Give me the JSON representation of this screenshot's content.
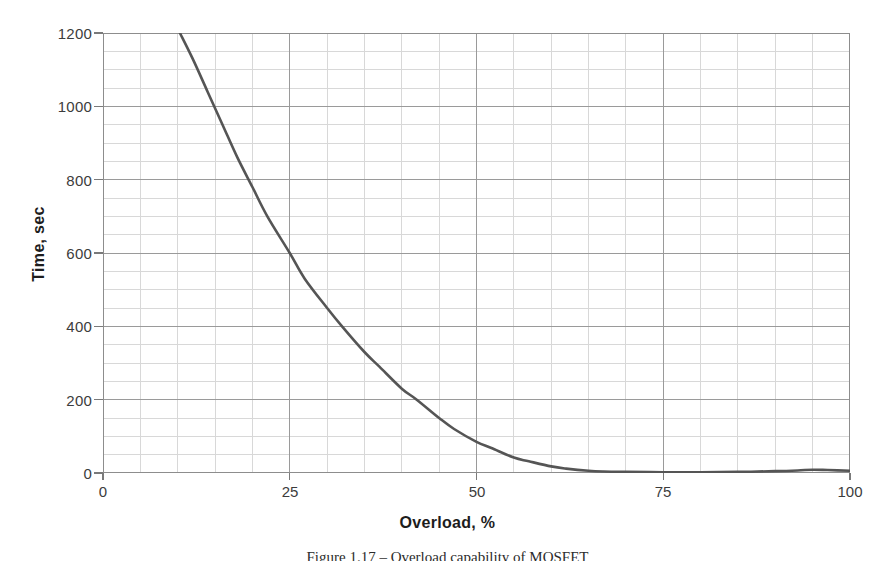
{
  "page": {
    "background_color": "#ffffff",
    "width": 895,
    "height": 561
  },
  "caption": {
    "text": "Figure 1.17 – Overload capability of MOSFET"
  },
  "chart_data": {
    "type": "line",
    "title": "",
    "subtitle": "",
    "xlabel": "Overload, %",
    "ylabel": "Time, sec",
    "xlim": [
      0,
      100
    ],
    "ylim": [
      0,
      1200
    ],
    "xticks": [
      0,
      25,
      50,
      75,
      100
    ],
    "yticks": [
      0,
      200,
      400,
      600,
      800,
      1000,
      1200
    ],
    "xtick_labels": [
      "0",
      "25",
      "50",
      "75",
      "100"
    ],
    "ytick_labels": [
      "0",
      "200",
      "400",
      "600",
      "800",
      "1000",
      "1200"
    ],
    "grid": true,
    "grid_major_color": "#9a9a9a",
    "grid_minor_color": "#d8d8d8",
    "minor_x_step": 5,
    "minor_y_step": 50,
    "legend": null,
    "legend_position": "none",
    "series": [
      {
        "name": "Overload capability",
        "color": "#555555",
        "line_width": 2.6,
        "x": [
          10.3,
          12,
          14,
          16,
          18,
          20,
          22,
          25,
          27,
          30,
          32,
          35,
          37,
          40,
          42,
          45,
          47,
          50,
          52,
          55,
          57,
          60,
          62,
          65,
          67,
          70,
          75,
          80,
          85,
          90,
          93,
          95,
          97,
          100
        ],
        "y": [
          1200,
          1130,
          1040,
          950,
          860,
          780,
          700,
          600,
          530,
          450,
          400,
          330,
          290,
          230,
          200,
          150,
          120,
          85,
          68,
          42,
          32,
          18,
          12,
          6,
          4,
          3,
          2,
          2,
          3,
          5,
          7,
          9,
          8,
          6
        ]
      }
    ],
    "annotations": []
  }
}
